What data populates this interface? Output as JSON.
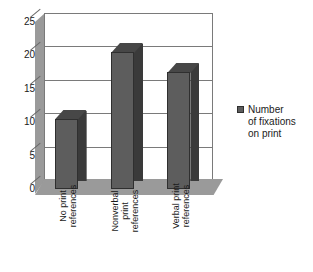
{
  "chart_data": {
    "type": "bar",
    "title": "",
    "subtitle": "",
    "xlabel": "",
    "ylabel": "",
    "ylim": [
      0,
      25
    ],
    "ytick_step": 5,
    "yticks": [
      25,
      20,
      15,
      10,
      5,
      0
    ],
    "grid": true,
    "style": "3d-column",
    "legend_position": "right",
    "categories": [
      "No print references",
      "Nonverbal print references",
      "Verbal print references"
    ],
    "category_lines": [
      [
        "No print",
        "references"
      ],
      [
        "Nonverbal",
        "print",
        "references"
      ],
      [
        "Verbal print",
        "references"
      ]
    ],
    "series": [
      {
        "name": "Number of fixations on print",
        "values": [
          10.5,
          20.5,
          17.5
        ]
      }
    ],
    "legend": [
      {
        "label_lines": [
          "Number",
          "of fixations",
          "on print"
        ],
        "label": "Number of fixations on print",
        "color": "#5d5d5d"
      }
    ],
    "colors": {
      "bar_front": "#5d5d5d",
      "bar_side": "#3a3a3a",
      "bar_top": "#474747",
      "wall": "#9a9a9a",
      "plot_background": "#ffffff",
      "gridline": "#7a7a7a",
      "text": "#1a1a1a",
      "page_background": "#ffffff"
    }
  }
}
